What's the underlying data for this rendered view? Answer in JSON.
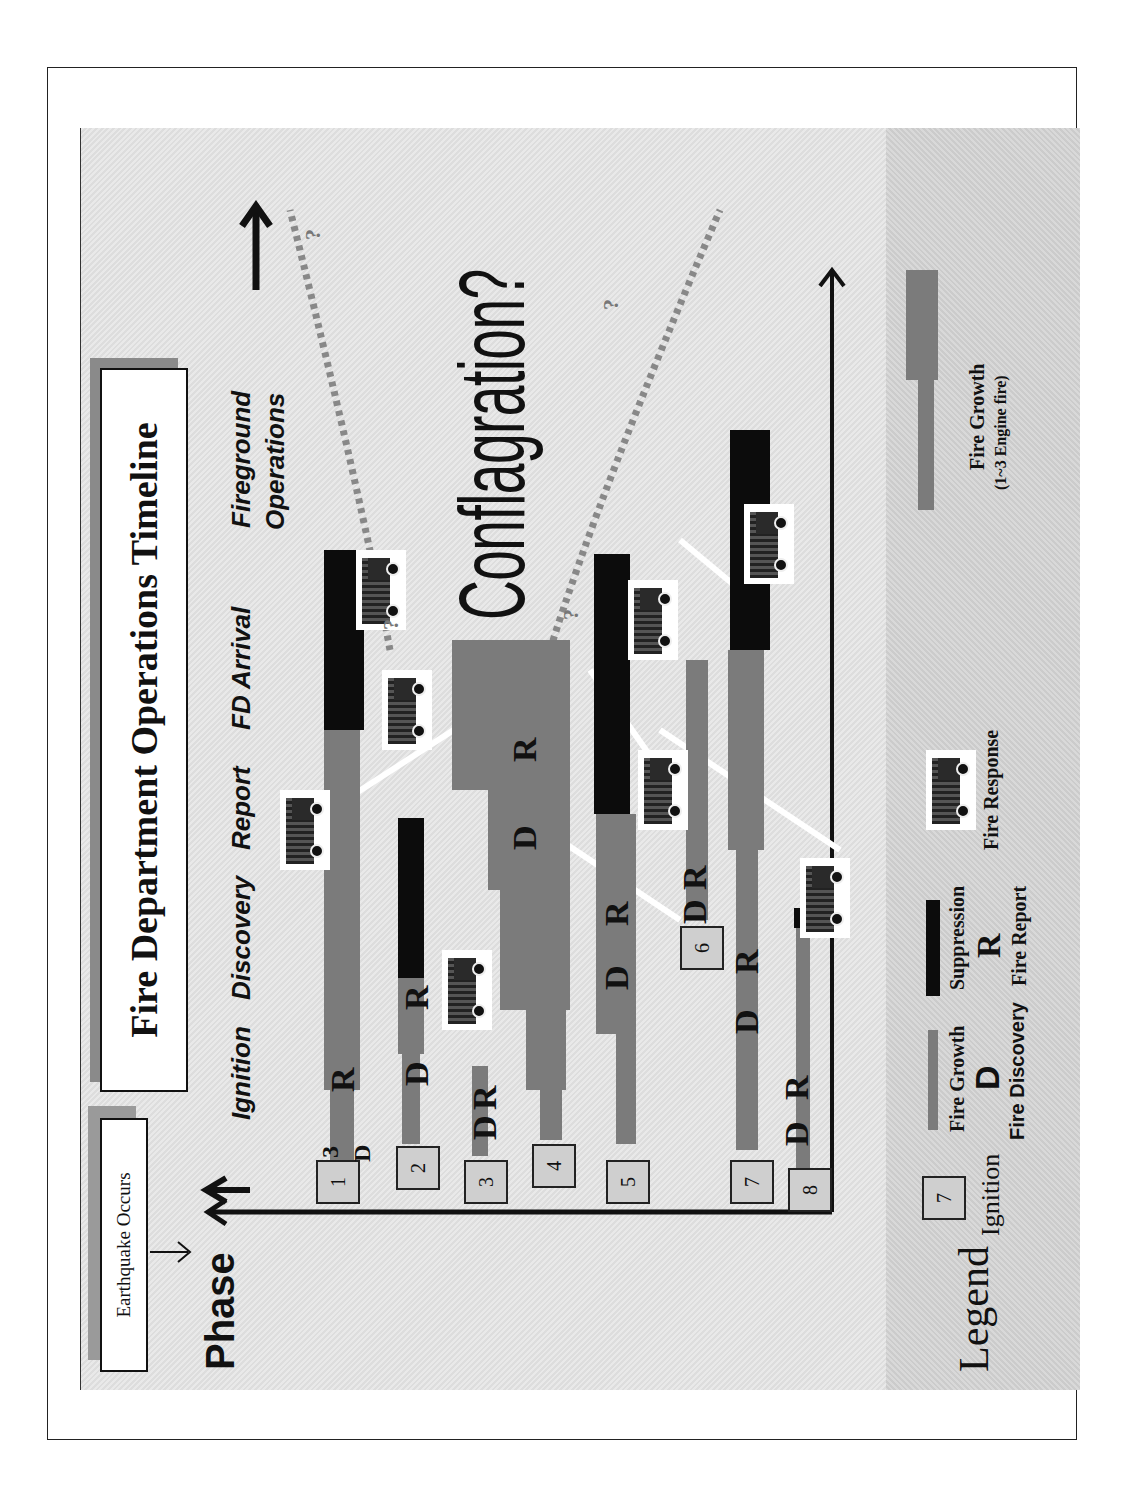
{
  "title": "Fire Department Operations Timeline",
  "event_box": "Earthquake Occurs",
  "axis": {
    "y_label": "Phase",
    "phases": [
      "Ignition",
      "Discovery",
      "Report",
      "FD Arrival",
      "Fireground",
      "Operations"
    ]
  },
  "outcome_label": "Conflagration?",
  "question_marks": [
    "?",
    "?",
    "?",
    "?"
  ],
  "ignitions": [
    {
      "id": "1",
      "discovery": "D",
      "report": "R",
      "extra": "3"
    },
    {
      "id": "2",
      "discovery": "D",
      "report": "R"
    },
    {
      "id": "3",
      "discovery": "D",
      "report": "R"
    },
    {
      "id": "4",
      "discovery": "D",
      "report": "R"
    },
    {
      "id": "5",
      "discovery": "D",
      "report": "R"
    },
    {
      "id": "6",
      "discovery": "D",
      "report": "R"
    },
    {
      "id": "7",
      "discovery": "D",
      "report": "R"
    },
    {
      "id": "8",
      "discovery": "D",
      "report": "R"
    }
  ],
  "legend": {
    "title": "Legend",
    "ignition_sample": "7",
    "ignition": "Ignition",
    "fire_growth": "Fire Growth",
    "discovery_letter": "D",
    "fire_discovery": "Fire Discovery",
    "suppression": "Suppression",
    "report_letter": "R",
    "fire_report": "Fire Report",
    "fire_response": "Fire Response",
    "fire_growth_engine": "Fire Growth",
    "engine_note": "(1~3 Engine fire)"
  },
  "colors": {
    "fire_growth": "#7b7b7b",
    "suppression": "#0c0c0c",
    "panel": "#e4e4e4",
    "legend_panel": "#d2d2d2"
  }
}
